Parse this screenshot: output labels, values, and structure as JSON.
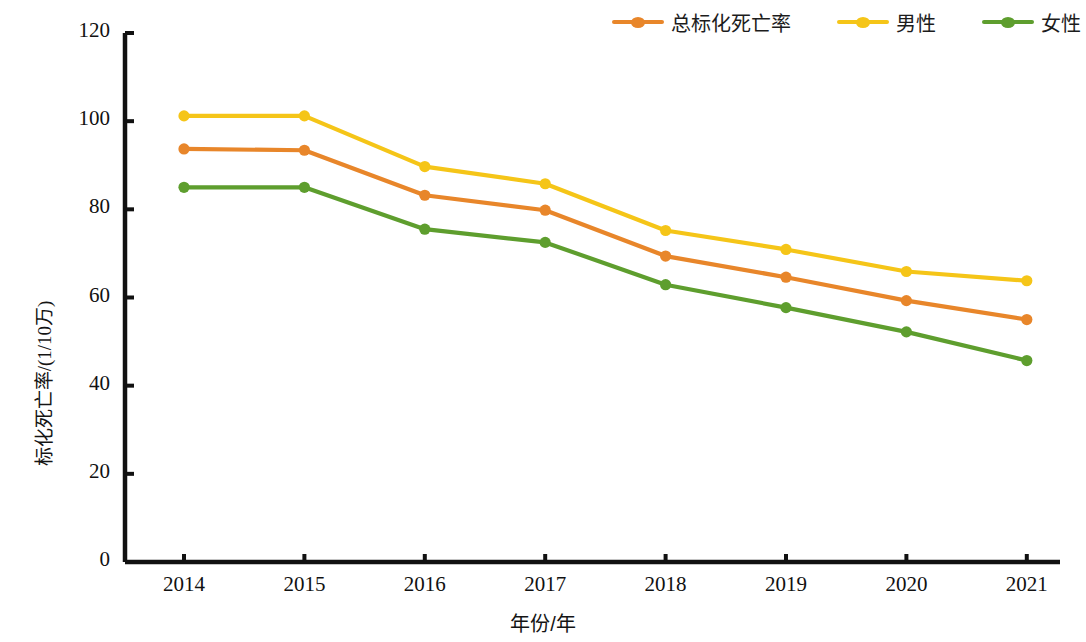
{
  "chart_data": {
    "type": "line",
    "title": "",
    "xlabel": "年份/年",
    "ylabel": "标化死亡率/(1/10万)",
    "categories": [
      "2014",
      "2015",
      "2016",
      "2017",
      "2018",
      "2019",
      "2020",
      "2021"
    ],
    "x": [
      2014,
      2015,
      2016,
      2017,
      2018,
      2019,
      2020,
      2021
    ],
    "series": [
      {
        "name": "总标化死亡率",
        "color": "#E8862A",
        "values": [
          93.7,
          93.4,
          83.2,
          79.8,
          69.4,
          64.6,
          59.3,
          55.0
        ]
      },
      {
        "name": "男性",
        "color": "#F5C518",
        "values": [
          101.2,
          101.2,
          89.7,
          85.8,
          75.2,
          70.9,
          65.9,
          63.8
        ]
      },
      {
        "name": "女性",
        "color": "#5E9E2E",
        "values": [
          85.0,
          85.0,
          75.5,
          72.5,
          62.9,
          57.7,
          52.2,
          45.7
        ]
      }
    ],
    "ylim": [
      0,
      120
    ],
    "yticks": [
      0,
      20,
      40,
      60,
      80,
      100,
      120
    ],
    "ytick_labels": [
      "0",
      "20",
      "40",
      "60",
      "80",
      "100",
      "120"
    ],
    "grid": false,
    "legend_position": "top-right",
    "axis_color": "#111111",
    "marker": "circle"
  },
  "legend": {
    "entries": [
      {
        "label": "总标化死亡率",
        "color": "#E8862A"
      },
      {
        "label": "男性",
        "color": "#F5C518"
      },
      {
        "label": "女性",
        "color": "#5E9E2E"
      }
    ]
  }
}
